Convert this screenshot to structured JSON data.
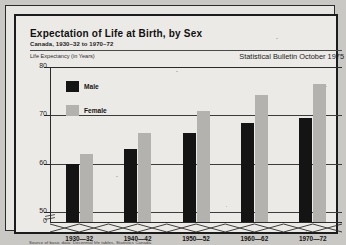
{
  "page": {
    "background_color": "#c9c8c4",
    "paper_color": "#eceae6"
  },
  "header": {
    "title": "Expectation of Life at Birth, by Sex",
    "subtitle": "Canada, 1930–32 to 1970–72",
    "axis_caption": "Life Expectancy (in Years)",
    "bulletin": "Statistical Bulletin October 1975"
  },
  "footer": {
    "source": "Source of basic data: Decennial life tables, Statistics Canada."
  },
  "legend": {
    "items": [
      {
        "label": "Male",
        "color": "#141414"
      },
      {
        "label": "Female",
        "color": "#b4b2ae"
      }
    ]
  },
  "axis": {
    "y_ticks": [
      "80",
      "70",
      "60",
      "50",
      "0"
    ],
    "y_break_between": [
      "50",
      "0"
    ]
  },
  "chart_data": {
    "type": "bar",
    "title": "Expectation of Life at Birth, by Sex",
    "subtitle": "Canada, 1930–32 to 1970–72",
    "xlabel": "",
    "ylabel": "Life Expectancy (in Years)",
    "ylim": [
      50,
      80
    ],
    "y_axis_broken_at_zero": true,
    "yticks": [
      50,
      60,
      70,
      80
    ],
    "grid": true,
    "legend_position": "top-left",
    "categories": [
      "1930—32",
      "1940—42",
      "1950—52",
      "1960—62",
      "1970—72"
    ],
    "series": [
      {
        "name": "Male",
        "color": "#141414",
        "values": [
          60.0,
          63.0,
          66.3,
          68.4,
          69.4
        ]
      },
      {
        "name": "Female",
        "color": "#b4b2ae",
        "values": [
          62.1,
          66.3,
          70.8,
          74.2,
          76.4
        ]
      }
    ],
    "annotations": [
      "Statistical Bulletin October 1975"
    ],
    "source": "Source of basic data: Decennial life tables, Statistics Canada."
  }
}
